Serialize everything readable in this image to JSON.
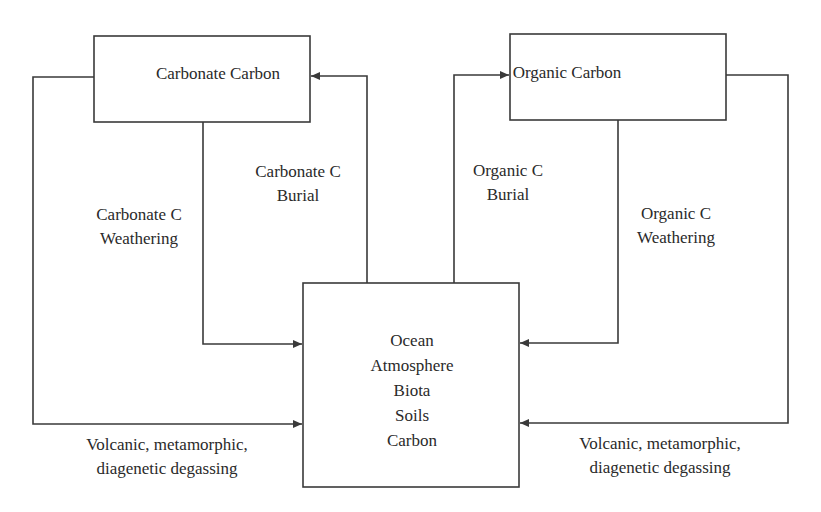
{
  "diagram": {
    "type": "flowchart",
    "nodes": {
      "carbonate": {
        "label": "Carbonate Carbon"
      },
      "organic": {
        "label": "Organic Carbon"
      },
      "ocean": {
        "lines": [
          "Ocean",
          "Atmosphere",
          "Biota",
          "Soils",
          "Carbon"
        ]
      }
    },
    "edges": {
      "carbonate_burial": {
        "from": "ocean",
        "to": "carbonate",
        "lines": [
          "Carbonate C",
          "Burial"
        ]
      },
      "carbonate_weathering": {
        "from": "carbonate",
        "to": "ocean",
        "lines": [
          "Carbonate C",
          "Weathering"
        ]
      },
      "carbonate_degassing": {
        "from": "carbonate",
        "to": "ocean",
        "lines": [
          "Volcanic, metamorphic,",
          "diagenetic degassing"
        ]
      },
      "organic_burial": {
        "from": "ocean",
        "to": "organic",
        "lines": [
          "Organic C",
          "Burial"
        ]
      },
      "organic_weathering": {
        "from": "organic",
        "to": "ocean",
        "lines": [
          "Organic C",
          "Weathering"
        ]
      },
      "organic_degassing": {
        "from": "organic",
        "to": "ocean",
        "lines": [
          "Volcanic, metamorphic,",
          "diagenetic degassing"
        ]
      }
    }
  }
}
